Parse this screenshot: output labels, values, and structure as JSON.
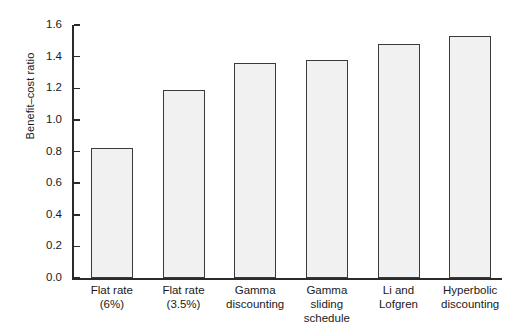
{
  "chart_data": {
    "type": "bar",
    "title": "",
    "xlabel": "",
    "ylabel": "Benefit–cost ratio",
    "ylim": [
      0.0,
      1.6
    ],
    "ytick_labels": [
      "1.6",
      "1.4",
      "1.2",
      "1.0",
      "0.8",
      "0.6",
      "0.4",
      "0.2",
      "0.0"
    ],
    "ytick_values": [
      1.6,
      1.4,
      1.2,
      1.0,
      0.8,
      0.6,
      0.4,
      0.2,
      0.0
    ],
    "grid": false,
    "legend": "none",
    "categories": [
      "Flat rate (6%)",
      "Flat rate (3.5%)",
      "Gamma discounting",
      "Gamma sliding schedule",
      "Li and Lofgren",
      "Hyperbolic discounting"
    ],
    "category_lines": [
      [
        "Flat rate",
        "(6%)"
      ],
      [
        "Flat rate",
        "(3.5%)"
      ],
      [
        "Gamma",
        "discounting"
      ],
      [
        "Gamma",
        "sliding",
        "schedule"
      ],
      [
        "Li and",
        "Lofgren"
      ],
      [
        "Hyperbolic",
        "discounting"
      ]
    ],
    "values": [
      0.82,
      1.19,
      1.36,
      1.38,
      1.48,
      1.53
    ],
    "bar_fill_color": "#f1f1f1",
    "bar_edge_color": "#3a3a3a",
    "axis_color": "#2b2b2b",
    "background_color": "#ffffff"
  }
}
